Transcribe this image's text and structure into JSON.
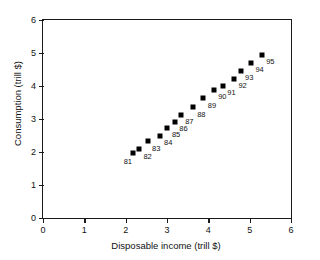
{
  "chart_data": {
    "type": "scatter",
    "title": "",
    "xlabel": "Disposable income (trill $)",
    "ylabel": "Consumption (trill $)",
    "xlim": [
      0,
      6
    ],
    "ylim": [
      0,
      6
    ],
    "xticks": [
      0,
      1,
      2,
      3,
      4,
      5,
      6
    ],
    "yticks": [
      0,
      1,
      2,
      3,
      4,
      5,
      6
    ],
    "xtick_labels": [
      "0",
      "1",
      "2",
      "3",
      "4",
      "5",
      "6"
    ],
    "ytick_labels": [
      "0",
      "1",
      "2",
      "3",
      "4",
      "5",
      "6"
    ],
    "grid": false,
    "legend": false,
    "marker": "square",
    "marker_color": "#000000",
    "points": [
      {
        "label": "81",
        "x": 2.17,
        "y": 1.98,
        "label_pos": "below-left"
      },
      {
        "label": "82",
        "x": 2.32,
        "y": 2.09,
        "label_pos": "below-right"
      },
      {
        "label": "83",
        "x": 2.53,
        "y": 2.32,
        "label_pos": "below-right"
      },
      {
        "label": "84",
        "x": 2.82,
        "y": 2.5,
        "label_pos": "below-right"
      },
      {
        "label": "85",
        "x": 3.01,
        "y": 2.74,
        "label_pos": "below-right"
      },
      {
        "label": "86",
        "x": 3.19,
        "y": 2.92,
        "label_pos": "below-right"
      },
      {
        "label": "87",
        "x": 3.33,
        "y": 3.13,
        "label_pos": "below-right"
      },
      {
        "label": "88",
        "x": 3.62,
        "y": 3.35,
        "label_pos": "below-right"
      },
      {
        "label": "89",
        "x": 3.88,
        "y": 3.63,
        "label_pos": "below-right"
      },
      {
        "label": "90",
        "x": 4.13,
        "y": 3.88,
        "label_pos": "below-right"
      },
      {
        "label": "91",
        "x": 4.35,
        "y": 4.01,
        "label_pos": "below-right"
      },
      {
        "label": "92",
        "x": 4.62,
        "y": 4.22,
        "label_pos": "below-right"
      },
      {
        "label": "93",
        "x": 4.78,
        "y": 4.46,
        "label_pos": "below-right"
      },
      {
        "label": "94",
        "x": 5.03,
        "y": 4.71,
        "label_pos": "below-right"
      },
      {
        "label": "95",
        "x": 5.29,
        "y": 4.95,
        "label_pos": "below-right"
      }
    ]
  }
}
